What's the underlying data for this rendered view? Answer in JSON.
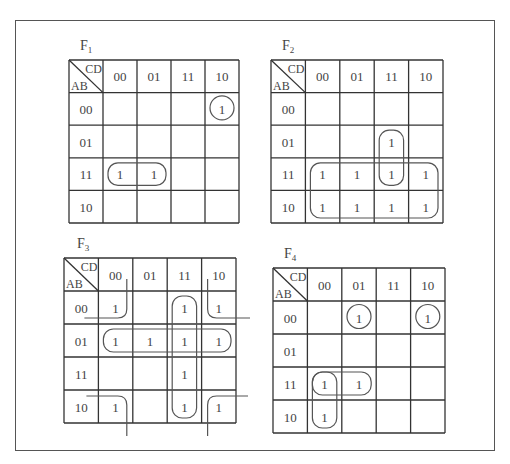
{
  "figure": {
    "maps": [
      {
        "id": "F1",
        "title": "F",
        "subscript": "1",
        "corner": {
          "col_var": "CD",
          "row_var": "AB"
        },
        "col_headers": [
          "00",
          "01",
          "11",
          "10"
        ],
        "row_headers": [
          "00",
          "01",
          "11",
          "10"
        ],
        "cells": [
          [
            "",
            "",
            "",
            "1"
          ],
          [
            "",
            "",
            "",
            ""
          ],
          [
            "1",
            "1",
            "",
            ""
          ],
          [
            "",
            "",
            "",
            ""
          ]
        ],
        "geometry": {
          "x": 69,
          "y": 60,
          "cw": 34,
          "ch": 32.6,
          "title_x": 80,
          "title_y": 50
        },
        "groups": [
          {
            "type": "circle",
            "row": 0,
            "col": 3
          },
          {
            "type": "rect",
            "r0": 2,
            "c0": 0,
            "r1": 2,
            "c1": 1
          }
        ]
      },
      {
        "id": "F2",
        "title": "F",
        "subscript": "2",
        "corner": {
          "col_var": "CD",
          "row_var": "AB"
        },
        "col_headers": [
          "00",
          "01",
          "11",
          "10"
        ],
        "row_headers": [
          "00",
          "01",
          "11",
          "10"
        ],
        "cells": [
          [
            "",
            "",
            "",
            ""
          ],
          [
            "",
            "",
            "1",
            ""
          ],
          [
            "1",
            "1",
            "1",
            "1"
          ],
          [
            "1",
            "1",
            "1",
            "1"
          ]
        ],
        "geometry": {
          "x": 271,
          "y": 60,
          "cw": 34.4,
          "ch": 32.6,
          "title_x": 282,
          "title_y": 50
        },
        "groups": [
          {
            "type": "rect",
            "r0": 1,
            "c0": 2,
            "r1": 2,
            "c1": 2
          },
          {
            "type": "rect",
            "r0": 2,
            "c0": 0,
            "r1": 3,
            "c1": 3
          }
        ]
      },
      {
        "id": "F3",
        "title": "F",
        "subscript": "3",
        "corner": {
          "col_var": "CD",
          "row_var": "AB"
        },
        "col_headers": [
          "00",
          "01",
          "11",
          "10"
        ],
        "row_headers": [
          "00",
          "01",
          "11",
          "10"
        ],
        "cells": [
          [
            "1",
            "",
            "1",
            "1"
          ],
          [
            "1",
            "1",
            "1",
            "1"
          ],
          [
            "",
            "",
            "1",
            ""
          ],
          [
            "1",
            "",
            "1",
            "1"
          ]
        ],
        "geometry": {
          "x": 64,
          "y": 258,
          "cw": 34.4,
          "ch": 33,
          "title_x": 77,
          "title_y": 248
        },
        "groups": [
          {
            "type": "rect",
            "r0": 1,
            "c0": 0,
            "r1": 1,
            "c1": 3
          },
          {
            "type": "rect",
            "r0": 0,
            "c0": 2,
            "r1": 3,
            "c1": 2
          },
          {
            "type": "corners",
            "cells": [
              [
                0,
                0
              ],
              [
                0,
                3
              ],
              [
                3,
                0
              ],
              [
                3,
                3
              ]
            ]
          }
        ]
      },
      {
        "id": "F4",
        "title": "F",
        "subscript": "4",
        "corner": {
          "col_var": "CD",
          "row_var": "AB"
        },
        "col_headers": [
          "00",
          "01",
          "11",
          "10"
        ],
        "row_headers": [
          "00",
          "01",
          "11",
          "10"
        ],
        "cells": [
          [
            "",
            "1",
            "",
            "1"
          ],
          [
            "",
            "",
            "",
            ""
          ],
          [
            "1",
            "1",
            "",
            ""
          ],
          [
            "1",
            "",
            "",
            ""
          ]
        ],
        "geometry": {
          "x": 273,
          "y": 268,
          "cw": 34.4,
          "ch": 33,
          "title_x": 284,
          "title_y": 258
        },
        "groups": [
          {
            "type": "circle",
            "row": 0,
            "col": 1
          },
          {
            "type": "circle",
            "row": 0,
            "col": 3
          },
          {
            "type": "rect",
            "r0": 2,
            "c0": 0,
            "r1": 2,
            "c1": 1
          },
          {
            "type": "rect",
            "r0": 2,
            "c0": 0,
            "r1": 3,
            "c1": 0
          }
        ]
      }
    ],
    "caption": "",
    "colors": {
      "grid": "#333333",
      "loop": "#555555",
      "text": "#444444",
      "frame": "#555555"
    }
  }
}
